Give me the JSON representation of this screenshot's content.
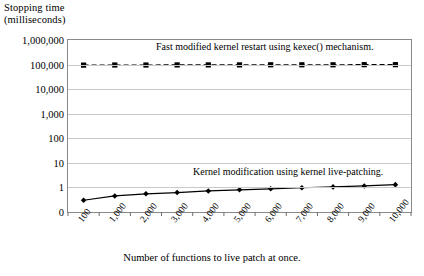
{
  "chart_data": {
    "type": "line",
    "title": "",
    "ylabel": "Stopping time (milliseconds)",
    "ylabel_lines": [
      "Stopping time",
      "(milliseconds)"
    ],
    "xlabel": "Number of functions to live patch at once.",
    "yscale": "log",
    "ytick_labels": [
      "1,000,000",
      "100,000",
      "10,000",
      "1,000",
      "100",
      "10",
      "1",
      "0"
    ],
    "ylim": [
      0,
      1000000
    ],
    "grid": true,
    "legend_position": "inline-annotations",
    "categories": [
      "100",
      "1,000",
      "2,000",
      "3,000",
      "4,000",
      "5,000",
      "6,000",
      "7,000",
      "8,000",
      "9,000",
      "10,000"
    ],
    "series": [
      {
        "name": "Fast modified kernel restart using kexec() mechanism.",
        "marker": "square",
        "line_style": "dashed",
        "color": "#000000",
        "values": [
          95000,
          96000,
          96000,
          97000,
          97000,
          97000,
          98000,
          98000,
          98000,
          99000,
          99000
        ]
      },
      {
        "name": "Kernel modification using kernel live-patching.",
        "marker": "diamond",
        "line_style": "solid",
        "color": "#000000",
        "values": [
          0.3,
          0.45,
          0.55,
          0.62,
          0.72,
          0.8,
          0.88,
          0.97,
          1.05,
          1.15,
          1.3
        ]
      }
    ],
    "annotations": [
      {
        "text": "Fast modified kernel restart using kexec() mechanism.",
        "series": 0
      },
      {
        "text": "Kernel modification using kernel live-patching.",
        "series": 1
      }
    ]
  }
}
